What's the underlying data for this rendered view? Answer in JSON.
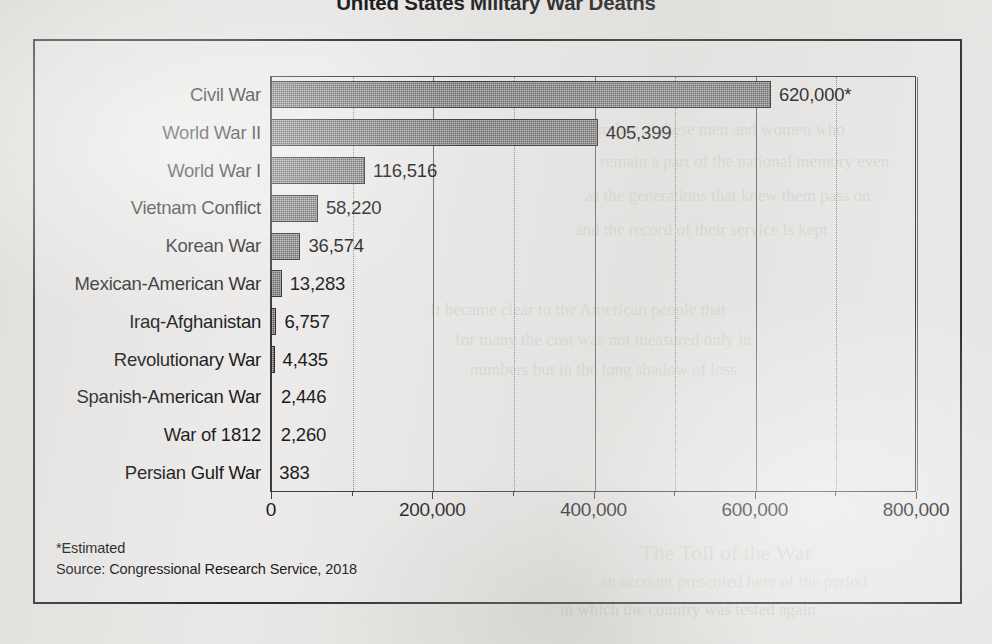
{
  "chart_data": {
    "type": "bar",
    "orientation": "horizontal",
    "title": "United States Military War Deaths",
    "xlabel": "",
    "ylabel": "",
    "xlim": [
      0,
      800000
    ],
    "grid": true,
    "legend": "none",
    "major_tick_interval": 200000,
    "minor_tick_interval": 100000,
    "categories": [
      "Civil War",
      "World War II",
      "World War I",
      "Vietnam Conflict",
      "Korean War",
      "Mexican-American War",
      "Iraq-Afghanistan",
      "Revolutionary War",
      "Spanish-American War",
      "War of 1812",
      "Persian Gulf War"
    ],
    "values": [
      620000,
      405399,
      116516,
      58220,
      36574,
      13283,
      6757,
      4435,
      2446,
      2260,
      383
    ],
    "data_labels": [
      "620,000*",
      "405,399",
      "116,516",
      "58,220",
      "36,574",
      "13,283",
      "6,757",
      "4,435",
      "2,446",
      "2,260",
      "383"
    ],
    "xticks": [
      0,
      200000,
      400000,
      600000,
      800000
    ],
    "xtick_labels": [
      "0",
      "200,000",
      "400,000",
      "600,000",
      "800,000"
    ],
    "annotations": [
      "*Estimated",
      "Source: Congressional Research Service, 2018"
    ],
    "colors": {
      "bar_fill": "#595959",
      "bar_stroke": "#2e2e31",
      "text": "#17171a",
      "gridline_major": "#6a6a6d",
      "gridline_minor": "#8c8c8f",
      "frame": "#2b2b2e",
      "page_background": "#e9e8e6"
    }
  },
  "footnotes": {
    "estimated_note": "*Estimated",
    "source_note": "Source: Congressional Research Service, 2018"
  },
  "page_bleed": {
    "lines": [
      "the number of these men and women who",
      "remain a part of the national memory even",
      "as the generations that knew them pass on",
      "and the record of their service is kept",
      "It became clear to the American people that",
      "for many the cost was not measured only in",
      "numbers but in the long shadow of loss",
      "The Toll of the War",
      "an account presented here of the period",
      "in which the country was tested again"
    ]
  }
}
